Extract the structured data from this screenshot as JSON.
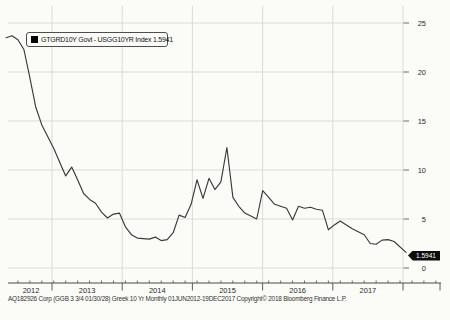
{
  "chart_data": {
    "type": "line",
    "title": "",
    "x_start": "2012-06",
    "x_end": "2017-12-19",
    "frequency": "monthly",
    "series": [
      {
        "name": "GTGRD10Y Govt - USGG10YR Index",
        "last_value": 1.5941,
        "values": [
          23.5,
          23.7,
          23.3,
          22.3,
          19.4,
          16.4,
          14.6,
          13.4,
          12.2,
          10.8,
          9.4,
          10.3,
          9.0,
          7.6,
          7.0,
          6.6,
          5.7,
          5.1,
          5.5,
          5.6,
          4.2,
          3.4,
          3.05,
          3.0,
          2.95,
          3.15,
          2.8,
          2.9,
          3.6,
          5.4,
          5.15,
          6.5,
          9.0,
          7.1,
          9.15,
          8.0,
          8.8,
          12.3,
          7.2,
          6.3,
          5.6,
          5.3,
          5.0,
          7.9,
          7.2,
          6.5,
          6.3,
          6.1,
          4.9,
          6.3,
          6.1,
          6.2,
          6.0,
          5.9,
          3.9,
          4.4,
          4.8,
          4.4,
          4.0,
          3.7,
          3.4,
          2.5,
          2.42,
          2.85,
          2.9,
          2.7,
          1.5941
        ]
      }
    ],
    "x_tick_labels": [
      "2012",
      "2013",
      "2014",
      "2015",
      "2016",
      "2017"
    ],
    "y_ticks": [
      0,
      5,
      10,
      15,
      20,
      25
    ],
    "y_tick_labels": [
      "0",
      "5",
      "10",
      "15",
      "20",
      "25"
    ],
    "ylim": [
      0,
      25.5
    ],
    "grid": true,
    "legend_position": "top-left"
  },
  "legend": {
    "marker": "black-square-icon",
    "label": "GTGRD10Y Govt - USGG10YR Index  1.5941"
  },
  "badge": {
    "value": "1.5941"
  },
  "footer": {
    "text": "AQ182926 Corp (GGB 3 3/4 01/30/28) Greek 10 Yr  Monthly 01JUN2012-19DEC2017  Copyright© 2018 Bloomberg Finance L.P."
  },
  "colors": {
    "background": "#fbfbf8",
    "gridline": "#d7d7d3",
    "axis": "#4a4a48",
    "series_line": "#3a3a3a",
    "badge_bg": "#0c0c0c",
    "badge_text": "#ffffff",
    "text": "#2b2b2b"
  }
}
